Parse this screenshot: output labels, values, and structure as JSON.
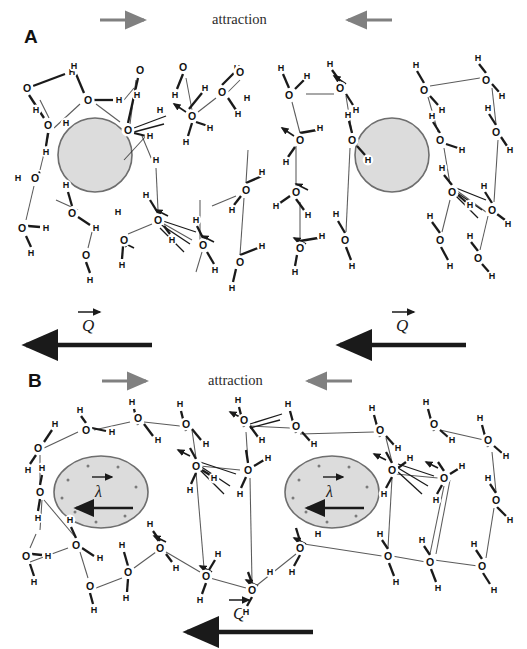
{
  "figure": {
    "type": "scientific-diagram",
    "background_color": "#ffffff",
    "ink_color": "#1a1a1a",
    "solute_fill": "#dcdcdc",
    "solute_stroke": "#6e6e6e",
    "gray_arrow_color": "#808080",
    "black_arrow_color": "#1a1a1a"
  },
  "panels": [
    {
      "id": "A",
      "letter": "A",
      "header_label": "attraction",
      "solute_shape": "circle",
      "solutes": [
        {
          "cx": 95,
          "cy": 155,
          "r": 37
        },
        {
          "cx": 392,
          "cy": 155,
          "r": 37
        }
      ],
      "gray_arrows": [
        {
          "direction": "right",
          "x1": 100,
          "x2": 148,
          "y": 20
        },
        {
          "direction": "left",
          "x1": 392,
          "x2": 344,
          "y": 20
        }
      ],
      "charge_vectors": [
        {
          "symbol": "Q",
          "label_x": 86,
          "label_y": 325,
          "arrow_x1": 152,
          "arrow_x2": 22,
          "arrow_y": 345
        },
        {
          "symbol": "Q",
          "label_x": 398,
          "label_y": 325,
          "arrow_x1": 466,
          "arrow_x2": 336,
          "arrow_y": 345
        }
      ]
    },
    {
      "id": "B",
      "letter": "B",
      "header_label": "attraction",
      "solute_shape": "ellipse",
      "solutes": [
        {
          "cx": 101,
          "cy": 492,
          "rx": 47,
          "ry": 36
        },
        {
          "cx": 332,
          "cy": 492,
          "rx": 47,
          "ry": 36
        }
      ],
      "gray_arrows": [
        {
          "direction": "right",
          "x1": 102,
          "x2": 150,
          "y": 381
        },
        {
          "direction": "left",
          "x1": 352,
          "x2": 304,
          "y": 381
        }
      ],
      "dipole_vectors": [
        {
          "symbol": "λ",
          "label_x": 98,
          "label_y": 490,
          "arrow_x1": 133,
          "arrow_x2": 74,
          "arrow_y": 508
        },
        {
          "symbol": "λ",
          "label_x": 329,
          "label_y": 490,
          "arrow_x1": 364,
          "arrow_x2": 305,
          "arrow_y": 508
        }
      ],
      "charge_vectors": [
        {
          "symbol": "Q",
          "label_x": 235,
          "label_y": 612,
          "arrow_x1": 313,
          "arrow_x2": 183,
          "arrow_y": 632
        }
      ]
    }
  ],
  "atom_labels": {
    "oxygen": "O",
    "hydrogen": "H"
  },
  "molecule_network": {
    "note": "Each node is an atom label O or H; solid short segments are covalent bonds, long thin segments are hydrogen bonds",
    "panelA": {
      "atoms": [
        {
          "t": "O",
          "x": 27,
          "y": 88
        },
        {
          "t": "H",
          "x": 72,
          "y": 72
        },
        {
          "t": "H",
          "x": 36,
          "y": 110
        },
        {
          "t": "O",
          "x": 48,
          "y": 125
        },
        {
          "t": "H",
          "x": 46,
          "y": 152
        },
        {
          "t": "O",
          "x": 35,
          "y": 178
        },
        {
          "t": "H",
          "x": 18,
          "y": 178
        },
        {
          "t": "O",
          "x": 22,
          "y": 228
        },
        {
          "t": "H",
          "x": 46,
          "y": 228
        },
        {
          "t": "H",
          "x": 31,
          "y": 253
        },
        {
          "t": "O",
          "x": 72,
          "y": 213
        },
        {
          "t": "H",
          "x": 66,
          "y": 185
        },
        {
          "t": "H",
          "x": 96,
          "y": 228
        },
        {
          "t": "O",
          "x": 86,
          "y": 255
        },
        {
          "t": "H",
          "x": 90,
          "y": 280
        },
        {
          "t": "H",
          "x": 118,
          "y": 212
        },
        {
          "t": "O",
          "x": 124,
          "y": 240
        },
        {
          "t": "H",
          "x": 122,
          "y": 265
        },
        {
          "t": "H",
          "x": 74,
          "y": 66
        },
        {
          "t": "O",
          "x": 88,
          "y": 100
        },
        {
          "t": "H",
          "x": 119,
          "y": 100
        },
        {
          "t": "H",
          "x": 66,
          "y": 123
        },
        {
          "t": "O",
          "x": 140,
          "y": 70
        },
        {
          "t": "H",
          "x": 137,
          "y": 95
        },
        {
          "t": "H",
          "x": 160,
          "y": 110
        },
        {
          "t": "O",
          "x": 128,
          "y": 130
        },
        {
          "t": "H",
          "x": 150,
          "y": 136
        },
        {
          "t": "H",
          "x": 156,
          "y": 160
        },
        {
          "t": "O",
          "x": 158,
          "y": 220
        },
        {
          "t": "H",
          "x": 146,
          "y": 195
        },
        {
          "t": "H",
          "x": 172,
          "y": 240
        },
        {
          "t": "O",
          "x": 183,
          "y": 67
        },
        {
          "t": "H",
          "x": 175,
          "y": 95
        },
        {
          "t": "H",
          "x": 205,
          "y": 88
        },
        {
          "t": "O",
          "x": 192,
          "y": 116
        },
        {
          "t": "H",
          "x": 186,
          "y": 142
        },
        {
          "t": "H",
          "x": 210,
          "y": 128
        },
        {
          "t": "O",
          "x": 222,
          "y": 92
        },
        {
          "t": "H",
          "x": 237,
          "y": 68
        },
        {
          "t": "H",
          "x": 238,
          "y": 114
        },
        {
          "t": "O",
          "x": 203,
          "y": 245
        },
        {
          "t": "H",
          "x": 196,
          "y": 220
        },
        {
          "t": "H",
          "x": 215,
          "y": 270
        },
        {
          "t": "O",
          "x": 240,
          "y": 72
        },
        {
          "t": "H",
          "x": 247,
          "y": 98
        },
        {
          "t": "O",
          "x": 246,
          "y": 190
        },
        {
          "t": "H",
          "x": 232,
          "y": 210
        },
        {
          "t": "H",
          "x": 262,
          "y": 172
        },
        {
          "t": "O",
          "x": 240,
          "y": 262
        },
        {
          "t": "H",
          "x": 232,
          "y": 288
        },
        {
          "t": "H",
          "x": 262,
          "y": 246
        },
        {
          "t": "O",
          "x": 289,
          "y": 95
        },
        {
          "t": "H",
          "x": 281,
          "y": 68
        },
        {
          "t": "H",
          "x": 307,
          "y": 76
        },
        {
          "t": "O",
          "x": 300,
          "y": 140
        },
        {
          "t": "H",
          "x": 286,
          "y": 162
        },
        {
          "t": "H",
          "x": 320,
          "y": 128
        },
        {
          "t": "O",
          "x": 296,
          "y": 192
        },
        {
          "t": "H",
          "x": 308,
          "y": 215
        },
        {
          "t": "H",
          "x": 276,
          "y": 206
        },
        {
          "t": "O",
          "x": 300,
          "y": 248
        },
        {
          "t": "H",
          "x": 295,
          "y": 272
        },
        {
          "t": "H",
          "x": 322,
          "y": 236
        },
        {
          "t": "O",
          "x": 340,
          "y": 88
        },
        {
          "t": "H",
          "x": 330,
          "y": 64
        },
        {
          "t": "H",
          "x": 356,
          "y": 110
        },
        {
          "t": "O",
          "x": 352,
          "y": 140
        },
        {
          "t": "H",
          "x": 348,
          "y": 115
        },
        {
          "t": "H",
          "x": 368,
          "y": 160
        },
        {
          "t": "O",
          "x": 345,
          "y": 240
        },
        {
          "t": "H",
          "x": 336,
          "y": 214
        },
        {
          "t": "H",
          "x": 352,
          "y": 266
        },
        {
          "t": "O",
          "x": 424,
          "y": 90
        },
        {
          "t": "H",
          "x": 416,
          "y": 65
        },
        {
          "t": "H",
          "x": 442,
          "y": 110
        },
        {
          "t": "O",
          "x": 440,
          "y": 140
        },
        {
          "t": "H",
          "x": 432,
          "y": 116
        },
        {
          "t": "H",
          "x": 462,
          "y": 150
        },
        {
          "t": "O",
          "x": 452,
          "y": 192
        },
        {
          "t": "H",
          "x": 442,
          "y": 168
        },
        {
          "t": "H",
          "x": 470,
          "y": 205
        },
        {
          "t": "O",
          "x": 440,
          "y": 240
        },
        {
          "t": "H",
          "x": 430,
          "y": 216
        },
        {
          "t": "H",
          "x": 450,
          "y": 266
        },
        {
          "t": "O",
          "x": 486,
          "y": 80
        },
        {
          "t": "H",
          "x": 478,
          "y": 58
        },
        {
          "t": "H",
          "x": 502,
          "y": 96
        },
        {
          "t": "O",
          "x": 496,
          "y": 132
        },
        {
          "t": "H",
          "x": 488,
          "y": 108
        },
        {
          "t": "H",
          "x": 510,
          "y": 150
        },
        {
          "t": "O",
          "x": 492,
          "y": 210
        },
        {
          "t": "H",
          "x": 484,
          "y": 186
        },
        {
          "t": "H",
          "x": 508,
          "y": 224
        },
        {
          "t": "O",
          "x": 478,
          "y": 258
        },
        {
          "t": "H",
          "x": 470,
          "y": 236
        },
        {
          "t": "H",
          "x": 492,
          "y": 276
        }
      ]
    },
    "panelB": {
      "atoms": [
        {
          "t": "O",
          "x": 38,
          "y": 448
        },
        {
          "t": "H",
          "x": 55,
          "y": 424
        },
        {
          "t": "H",
          "x": 28,
          "y": 470
        },
        {
          "t": "O",
          "x": 40,
          "y": 492
        },
        {
          "t": "H",
          "x": 42,
          "y": 468
        },
        {
          "t": "H",
          "x": 38,
          "y": 518
        },
        {
          "t": "O",
          "x": 26,
          "y": 556
        },
        {
          "t": "H",
          "x": 48,
          "y": 556
        },
        {
          "t": "H",
          "x": 34,
          "y": 582
        },
        {
          "t": "O",
          "x": 76,
          "y": 545
        },
        {
          "t": "H",
          "x": 70,
          "y": 520
        },
        {
          "t": "H",
          "x": 100,
          "y": 558
        },
        {
          "t": "O",
          "x": 90,
          "y": 586
        },
        {
          "t": "H",
          "x": 94,
          "y": 610
        },
        {
          "t": "H",
          "x": 122,
          "y": 545
        },
        {
          "t": "O",
          "x": 128,
          "y": 572
        },
        {
          "t": "H",
          "x": 126,
          "y": 598
        },
        {
          "t": "O",
          "x": 86,
          "y": 430
        },
        {
          "t": "H",
          "x": 80,
          "y": 410
        },
        {
          "t": "H",
          "x": 112,
          "y": 432
        },
        {
          "t": "O",
          "x": 138,
          "y": 418
        },
        {
          "t": "H",
          "x": 132,
          "y": 402
        },
        {
          "t": "H",
          "x": 158,
          "y": 440
        },
        {
          "t": "O",
          "x": 160,
          "y": 548
        },
        {
          "t": "H",
          "x": 150,
          "y": 524
        },
        {
          "t": "H",
          "x": 176,
          "y": 568
        },
        {
          "t": "O",
          "x": 186,
          "y": 424
        },
        {
          "t": "H",
          "x": 180,
          "y": 404
        },
        {
          "t": "H",
          "x": 206,
          "y": 444
        },
        {
          "t": "O",
          "x": 196,
          "y": 466
        },
        {
          "t": "H",
          "x": 190,
          "y": 490
        },
        {
          "t": "H",
          "x": 214,
          "y": 478
        },
        {
          "t": "O",
          "x": 206,
          "y": 576
        },
        {
          "t": "H",
          "x": 200,
          "y": 600
        },
        {
          "t": "H",
          "x": 218,
          "y": 554
        },
        {
          "t": "O",
          "x": 244,
          "y": 420
        },
        {
          "t": "H",
          "x": 238,
          "y": 400
        },
        {
          "t": "H",
          "x": 262,
          "y": 440
        },
        {
          "t": "O",
          "x": 248,
          "y": 470
        },
        {
          "t": "H",
          "x": 240,
          "y": 494
        },
        {
          "t": "H",
          "x": 268,
          "y": 458
        },
        {
          "t": "O",
          "x": 252,
          "y": 590
        },
        {
          "t": "H",
          "x": 246,
          "y": 612
        },
        {
          "t": "H",
          "x": 270,
          "y": 572
        },
        {
          "t": "O",
          "x": 296,
          "y": 426
        },
        {
          "t": "H",
          "x": 288,
          "y": 404
        },
        {
          "t": "H",
          "x": 314,
          "y": 444
        },
        {
          "t": "O",
          "x": 300,
          "y": 548
        },
        {
          "t": "H",
          "x": 292,
          "y": 572
        },
        {
          "t": "H",
          "x": 318,
          "y": 534
        },
        {
          "t": "O",
          "x": 380,
          "y": 430
        },
        {
          "t": "H",
          "x": 372,
          "y": 408
        },
        {
          "t": "H",
          "x": 398,
          "y": 448
        },
        {
          "t": "O",
          "x": 392,
          "y": 470
        },
        {
          "t": "H",
          "x": 384,
          "y": 494
        },
        {
          "t": "H",
          "x": 410,
          "y": 458
        },
        {
          "t": "O",
          "x": 388,
          "y": 556
        },
        {
          "t": "H",
          "x": 380,
          "y": 534
        },
        {
          "t": "H",
          "x": 396,
          "y": 582
        },
        {
          "t": "O",
          "x": 434,
          "y": 424
        },
        {
          "t": "H",
          "x": 426,
          "y": 402
        },
        {
          "t": "H",
          "x": 452,
          "y": 440
        },
        {
          "t": "O",
          "x": 444,
          "y": 478
        },
        {
          "t": "H",
          "x": 436,
          "y": 500
        },
        {
          "t": "H",
          "x": 462,
          "y": 466
        },
        {
          "t": "O",
          "x": 430,
          "y": 562
        },
        {
          "t": "H",
          "x": 422,
          "y": 540
        },
        {
          "t": "H",
          "x": 438,
          "y": 588
        },
        {
          "t": "O",
          "x": 488,
          "y": 440
        },
        {
          "t": "H",
          "x": 480,
          "y": 418
        },
        {
          "t": "H",
          "x": 506,
          "y": 456
        },
        {
          "t": "O",
          "x": 496,
          "y": 500
        },
        {
          "t": "H",
          "x": 488,
          "y": 478
        },
        {
          "t": "H",
          "x": 510,
          "y": 520
        },
        {
          "t": "O",
          "x": 482,
          "y": 566
        },
        {
          "t": "H",
          "x": 474,
          "y": 544
        },
        {
          "t": "H",
          "x": 494,
          "y": 590
        }
      ]
    }
  }
}
